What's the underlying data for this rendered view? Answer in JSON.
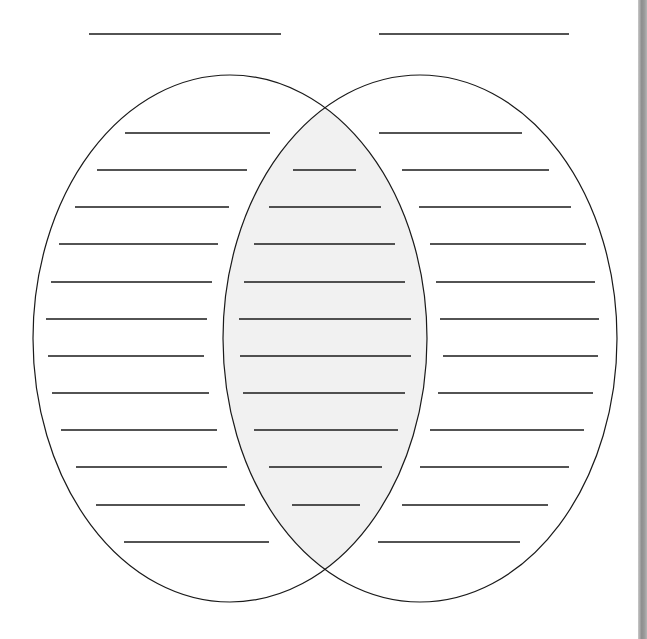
{
  "diagram": {
    "type": "venn",
    "title": "",
    "colors": {
      "stroke": "#1a1a1a",
      "intersection_fill": "#f1f1f1",
      "background": "#ffffff",
      "edge_strip": "#9a9a9a"
    },
    "header_lines": [
      {
        "name": "left-set-title-blank",
        "x1": 89,
        "x2": 281,
        "y": 34,
        "value": ""
      },
      {
        "name": "right-set-title-blank",
        "x1": 379,
        "x2": 569,
        "y": 34,
        "value": ""
      }
    ],
    "sets": [
      {
        "name": "left-set",
        "cx": 230,
        "cy": 338.5,
        "rx": 197,
        "ry": 263.5
      },
      {
        "name": "right-set",
        "cx": 420,
        "cy": 338.5,
        "rx": 197,
        "ry": 263.5
      }
    ],
    "writing_lines": {
      "left_only": [
        {
          "y": 133,
          "x1": 125,
          "x2": 270,
          "value": ""
        },
        {
          "y": 170,
          "x1": 97,
          "x2": 247,
          "value": ""
        },
        {
          "y": 207,
          "x1": 75,
          "x2": 229,
          "value": ""
        },
        {
          "y": 244,
          "x1": 59,
          "x2": 218,
          "value": ""
        },
        {
          "y": 282,
          "x1": 51,
          "x2": 212,
          "value": ""
        },
        {
          "y": 319,
          "x1": 46,
          "x2": 207,
          "value": ""
        },
        {
          "y": 356,
          "x1": 48,
          "x2": 204,
          "value": ""
        },
        {
          "y": 393,
          "x1": 52,
          "x2": 209,
          "value": ""
        },
        {
          "y": 430,
          "x1": 61,
          "x2": 217,
          "value": ""
        },
        {
          "y": 467,
          "x1": 76,
          "x2": 227,
          "value": ""
        },
        {
          "y": 505,
          "x1": 96,
          "x2": 245,
          "value": ""
        },
        {
          "y": 542,
          "x1": 124,
          "x2": 269,
          "value": ""
        }
      ],
      "both": [
        {
          "y": 170,
          "x1": 293,
          "x2": 356,
          "value": ""
        },
        {
          "y": 207,
          "x1": 269,
          "x2": 381,
          "value": ""
        },
        {
          "y": 244,
          "x1": 254,
          "x2": 395,
          "value": ""
        },
        {
          "y": 282,
          "x1": 244,
          "x2": 405,
          "value": ""
        },
        {
          "y": 319,
          "x1": 239,
          "x2": 411,
          "value": ""
        },
        {
          "y": 356,
          "x1": 240,
          "x2": 411,
          "value": ""
        },
        {
          "y": 393,
          "x1": 243,
          "x2": 405,
          "value": ""
        },
        {
          "y": 430,
          "x1": 254,
          "x2": 398,
          "value": ""
        },
        {
          "y": 467,
          "x1": 269,
          "x2": 382,
          "value": ""
        },
        {
          "y": 505,
          "x1": 292,
          "x2": 360,
          "value": ""
        }
      ],
      "right_only": [
        {
          "y": 133,
          "x1": 379,
          "x2": 522,
          "value": ""
        },
        {
          "y": 170,
          "x1": 402,
          "x2": 549,
          "value": ""
        },
        {
          "y": 207,
          "x1": 419,
          "x2": 571,
          "value": ""
        },
        {
          "y": 244,
          "x1": 430,
          "x2": 586,
          "value": ""
        },
        {
          "y": 282,
          "x1": 436,
          "x2": 595,
          "value": ""
        },
        {
          "y": 319,
          "x1": 440,
          "x2": 599,
          "value": ""
        },
        {
          "y": 356,
          "x1": 443,
          "x2": 598,
          "value": ""
        },
        {
          "y": 393,
          "x1": 438,
          "x2": 593,
          "value": ""
        },
        {
          "y": 430,
          "x1": 430,
          "x2": 584,
          "value": ""
        },
        {
          "y": 467,
          "x1": 420,
          "x2": 569,
          "value": ""
        },
        {
          "y": 505,
          "x1": 402,
          "x2": 548,
          "value": ""
        },
        {
          "y": 542,
          "x1": 378,
          "x2": 520,
          "value": ""
        }
      ]
    }
  }
}
